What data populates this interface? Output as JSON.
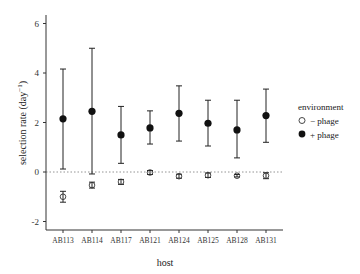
{
  "chart_data": {
    "type": "scatter",
    "title": "",
    "xlabel": "host",
    "ylabel": "selection rate (day⁻¹)",
    "ylim": [
      -2.4,
      6.4
    ],
    "yticks": [
      -2,
      0,
      2,
      4,
      6
    ],
    "grid": false,
    "reference_line": {
      "y": 0,
      "style": "dotted"
    },
    "categories": [
      "AB113",
      "AB114",
      "AB117",
      "AB121",
      "AB124",
      "AB125",
      "AB128",
      "AB131"
    ],
    "legend": {
      "title": "environment",
      "position": "right"
    },
    "series": [
      {
        "name": "− phage",
        "marker": "open-circle",
        "values": [
          -1.0,
          -0.53,
          -0.4,
          -0.02,
          -0.17,
          -0.13,
          -0.15,
          -0.15
        ],
        "lower": [
          -1.22,
          -0.65,
          -0.5,
          -0.1,
          -0.25,
          -0.22,
          -0.2,
          -0.27
        ],
        "upper": [
          -0.78,
          -0.41,
          -0.3,
          0.06,
          -0.09,
          -0.04,
          -0.1,
          -0.03
        ]
      },
      {
        "name": "+ phage",
        "marker": "filled-circle",
        "values": [
          2.15,
          2.45,
          1.5,
          1.78,
          2.37,
          1.97,
          1.7,
          2.28
        ],
        "lower": [
          0.12,
          -0.08,
          0.35,
          1.13,
          1.25,
          1.05,
          0.57,
          1.2
        ],
        "upper": [
          4.16,
          5.0,
          2.65,
          2.47,
          3.48,
          2.9,
          2.9,
          3.35
        ]
      }
    ]
  },
  "labels": {
    "xlabel": "host",
    "ylabel_main": "selection rate (day",
    "ylabel_sup": "−1",
    "ylabel_end": ")",
    "legend_title": "environment",
    "legend_minus": "− phage",
    "legend_plus": "+ phage"
  }
}
